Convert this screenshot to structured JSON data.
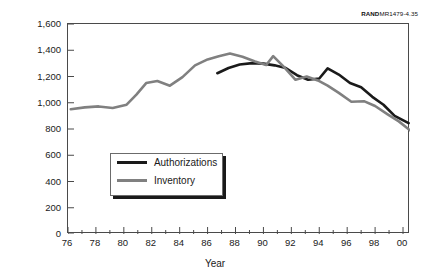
{
  "credit": {
    "brand": "RAND",
    "code": "MR1479-4.35"
  },
  "axis": {
    "ylabel": "Officers",
    "xlabel": "Year",
    "ytick_labels": [
      "0",
      "200",
      "400",
      "600",
      "800",
      "1,000",
      "1,200",
      "1,400",
      "1,600"
    ],
    "xtick_labels": [
      "76",
      "78",
      "80",
      "82",
      "84",
      "86",
      "88",
      "90",
      "92",
      "94",
      "96",
      "98",
      "00"
    ]
  },
  "legend": {
    "items": [
      {
        "label": "Authorizations",
        "color": "#1a1a1a"
      },
      {
        "label": "Inventory",
        "color": "#808080"
      }
    ]
  },
  "chart_data": {
    "type": "line",
    "title": "",
    "xlabel": "Year",
    "ylabel": "Officers",
    "xlim": [
      1976,
      2000.5
    ],
    "ylim": [
      0,
      1600
    ],
    "yticks": [
      0,
      200,
      400,
      600,
      800,
      1000,
      1200,
      1400,
      1600
    ],
    "xticks": [
      1976,
      1978,
      1980,
      1982,
      1984,
      1986,
      1988,
      1990,
      1992,
      1994,
      1996,
      1998,
      2000
    ],
    "xtick_labels": [
      "76",
      "78",
      "80",
      "82",
      "84",
      "86",
      "88",
      "90",
      "92",
      "94",
      "96",
      "98",
      "00"
    ],
    "minor_xticks_every": 1,
    "grid": false,
    "legend_position": "center-left",
    "series": [
      {
        "name": "Authorizations",
        "color": "#1a1a1a",
        "x": [
          1986.7,
          1987.5,
          1988.3,
          1989.2,
          1990.0,
          1990.8,
          1991.6,
          1992.4,
          1993.2,
          1994.0,
          1994.6,
          1995.4,
          1996.2,
          1997.0,
          1997.8,
          1998.6,
          1999.4,
          2000.4
        ],
        "y": [
          1225,
          1265,
          1292,
          1302,
          1298,
          1285,
          1265,
          1210,
          1175,
          1185,
          1262,
          1215,
          1150,
          1118,
          1045,
          985,
          900,
          845
        ]
      },
      {
        "name": "Inventory",
        "color": "#808080",
        "x": [
          1976.2,
          1977.2,
          1978.2,
          1979.2,
          1980.2,
          1980.9,
          1981.6,
          1982.4,
          1983.3,
          1984.2,
          1985.1,
          1986.0,
          1986.8,
          1987.6,
          1988.5,
          1989.4,
          1990.2,
          1990.7,
          1991.5,
          1992.3,
          1993.1,
          1993.9,
          1994.6,
          1995.4,
          1996.3,
          1997.2,
          1998.0,
          1998.9,
          1999.7,
          2000.5
        ],
        "y": [
          950,
          965,
          972,
          960,
          985,
          1062,
          1150,
          1165,
          1130,
          1195,
          1285,
          1330,
          1355,
          1375,
          1350,
          1315,
          1288,
          1355,
          1270,
          1175,
          1200,
          1170,
          1130,
          1075,
          1008,
          1012,
          975,
          912,
          858,
          790
        ]
      }
    ]
  }
}
